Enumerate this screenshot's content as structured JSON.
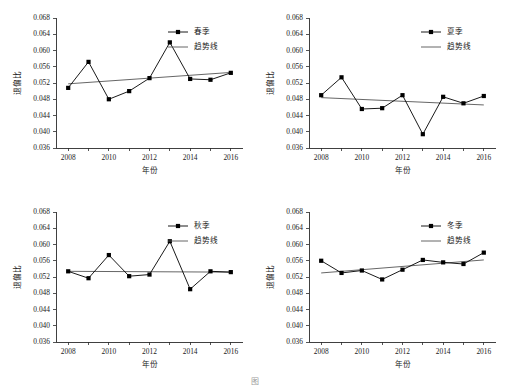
{
  "figure": {
    "caption": "图",
    "panel_count": 4
  },
  "axes": {
    "xlabel": "年份",
    "ylabel": "退偏比",
    "ylim": [
      0.036,
      0.068
    ],
    "yticks": [
      0.036,
      0.04,
      0.044,
      0.048,
      0.052,
      0.056,
      0.06,
      0.064,
      0.068
    ],
    "ytick_labels": [
      "0.036",
      "0.040",
      "0.044",
      "0.048",
      "0.052",
      "0.056",
      "0.060",
      "0.064",
      "0.068"
    ],
    "xlim": [
      2007.4,
      2016.6
    ],
    "xticks": [
      2008,
      2009,
      2010,
      2011,
      2012,
      2013,
      2014,
      2015,
      2016
    ],
    "xtick_labels": [
      "2008",
      "",
      "2010",
      "",
      "2012",
      "",
      "2014",
      "",
      "2016"
    ],
    "grid": false
  },
  "legend": {
    "trend_label": "趋势线",
    "position": "top-right"
  },
  "chart_data": [
    {
      "type": "line",
      "title": "",
      "series_name": "春季",
      "legend": [
        "春季",
        "趋势线"
      ],
      "xlabel": "年份",
      "ylabel": "退偏比",
      "ylim": [
        0.036,
        0.068
      ],
      "xlim": [
        2007.4,
        2016.6
      ],
      "grid": false,
      "x": [
        2008,
        2009,
        2010,
        2011,
        2012,
        2013,
        2014,
        2015,
        2016
      ],
      "values": [
        0.0508,
        0.0572,
        0.048,
        0.05,
        0.0532,
        0.062,
        0.053,
        0.0528,
        0.0545
      ],
      "trend": {
        "name": "趋势线",
        "x": [
          2008,
          2016
        ],
        "y": [
          0.0518,
          0.0546
        ]
      }
    },
    {
      "type": "line",
      "title": "",
      "series_name": "夏季",
      "legend": [
        "夏季",
        "趋势线"
      ],
      "xlabel": "年份",
      "ylabel": "退偏比",
      "ylim": [
        0.036,
        0.068
      ],
      "xlim": [
        2007.4,
        2016.6
      ],
      "grid": false,
      "x": [
        2008,
        2009,
        2010,
        2011,
        2012,
        2013,
        2014,
        2015,
        2016
      ],
      "values": [
        0.049,
        0.0534,
        0.0456,
        0.0458,
        0.049,
        0.0394,
        0.0486,
        0.047,
        0.0488
      ],
      "trend": {
        "name": "趋势线",
        "x": [
          2008,
          2016
        ],
        "y": [
          0.0484,
          0.0466
        ]
      }
    },
    {
      "type": "line",
      "title": "",
      "series_name": "秋季",
      "legend": [
        "秋季",
        "趋势线"
      ],
      "xlabel": "年份",
      "ylabel": "退偏比",
      "ylim": [
        0.036,
        0.068
      ],
      "xlim": [
        2007.4,
        2016.6
      ],
      "grid": false,
      "x": [
        2008,
        2009,
        2010,
        2011,
        2012,
        2013,
        2014,
        2015,
        2016
      ],
      "values": [
        0.0534,
        0.0517,
        0.0574,
        0.0522,
        0.0526,
        0.0608,
        0.049,
        0.0534,
        0.0532
      ],
      "trend": {
        "name": "趋势线",
        "x": [
          2008,
          2016
        ],
        "y": [
          0.0534,
          0.0532
        ]
      }
    },
    {
      "type": "line",
      "title": "",
      "series_name": "冬季",
      "legend": [
        "冬季",
        "趋势线"
      ],
      "xlabel": "年份",
      "ylabel": "退偏比",
      "ylim": [
        0.036,
        0.068
      ],
      "xlim": [
        2007.4,
        2016.6
      ],
      "grid": false,
      "x": [
        2008,
        2009,
        2010,
        2011,
        2012,
        2013,
        2014,
        2015,
        2016
      ],
      "values": [
        0.056,
        0.053,
        0.0536,
        0.0514,
        0.0538,
        0.0562,
        0.0556,
        0.0552,
        0.058
      ],
      "trend": {
        "name": "趋势线",
        "x": [
          2008,
          2016
        ],
        "y": [
          0.053,
          0.0562
        ]
      }
    }
  ],
  "colors": {
    "series": "#000000",
    "trend": "#555555",
    "axis": "#2b2b2b",
    "text": "#1a1a1a",
    "background": "#ffffff"
  }
}
